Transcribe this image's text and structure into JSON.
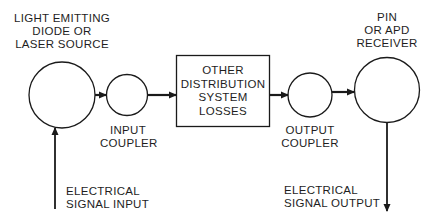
{
  "diagram": {
    "colors": {
      "stroke": "#1a1a1a",
      "background": "#ffffff",
      "text": "#1e1e1e"
    },
    "nodes": {
      "source": {
        "label_lines": [
          "LIGHT EMITTING",
          "DIODE OR",
          "LASER SOURCE"
        ]
      },
      "input_coupler": {
        "label_lines": [
          "INPUT",
          "COUPLER"
        ]
      },
      "distribution": {
        "label_lines": [
          "OTHER",
          "DISTRIBUTION",
          "SYSTEM",
          "LOSSES"
        ]
      },
      "output_coupler": {
        "label_lines": [
          "OUTPUT",
          "COUPLER"
        ]
      },
      "receiver": {
        "label_lines": [
          "PIN",
          "OR APD",
          "RECEIVER"
        ]
      }
    },
    "io": {
      "input": {
        "label_lines": [
          "ELECTRICAL",
          "SIGNAL INPUT"
        ]
      },
      "output": {
        "label_lines": [
          "ELECTRICAL",
          "SIGNAL OUTPUT"
        ]
      }
    },
    "edges": [
      {
        "from": "electrical_input",
        "to": "source"
      },
      {
        "from": "source",
        "to": "input_coupler"
      },
      {
        "from": "input_coupler",
        "to": "distribution"
      },
      {
        "from": "distribution",
        "to": "output_coupler"
      },
      {
        "from": "output_coupler",
        "to": "receiver"
      },
      {
        "from": "receiver",
        "to": "electrical_output"
      }
    ]
  }
}
